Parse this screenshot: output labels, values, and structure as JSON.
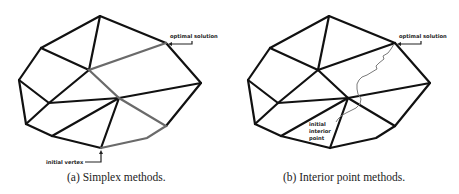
{
  "figure": {
    "panels": [
      {
        "id": "a",
        "caption": "(a) Simplex methods.",
        "labels": {
          "optimal": "optimal solution",
          "start": "initial vertex"
        },
        "colors": {
          "edge": "#111111",
          "path": "#6a6a6a"
        }
      },
      {
        "id": "b",
        "caption": "(b) Interior point methods.",
        "labels": {
          "optimal": "optimal solution",
          "start_line1": "initial",
          "start_line2": "interior",
          "start_line3": "point"
        },
        "colors": {
          "edge": "#111111",
          "path": "#7a7a7a"
        }
      }
    ]
  }
}
